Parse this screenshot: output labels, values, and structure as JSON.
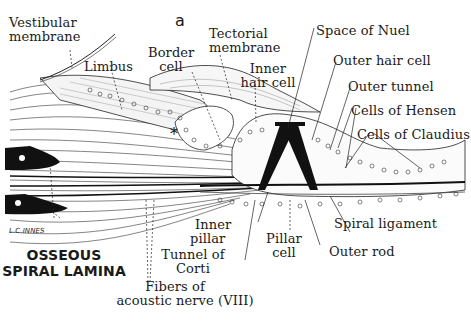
{
  "figure": {
    "panel_letter": "a",
    "signature": "L.C.INNES",
    "asterisk": "*",
    "labels": {
      "vestibular_membrane": [
        "Vestibular",
        "membrane"
      ],
      "limbus": "Limbus",
      "border_cell": [
        "Border",
        "cell"
      ],
      "tectorial_membrane": [
        "Tectorial",
        "membrane"
      ],
      "inner_hair_cell": [
        "Inner",
        "hair cell"
      ],
      "space_of_nuel": "Space of Nuel",
      "outer_hair_cell": "Outer hair cell",
      "outer_tunnel": "Outer tunnel",
      "cells_of_hensen": "Cells of Hensen",
      "cells_of_claudius": "Cells of Claudius",
      "osseous_spiral_lamina": [
        "OSSEOUS",
        "SPIRAL LAMINA"
      ],
      "inner_pillar": [
        "Inner",
        "pillar"
      ],
      "tunnel_of_corti": [
        "Tunnel of",
        "Corti"
      ],
      "pillar_cell": [
        "Pillar",
        "cell"
      ],
      "outer_rod": "Outer rod",
      "spiral_ligament": "Spiral ligament",
      "fibers_of_acoustic_nerve": [
        "Fibers of",
        "acoustic nerve (VIII)"
      ]
    }
  }
}
